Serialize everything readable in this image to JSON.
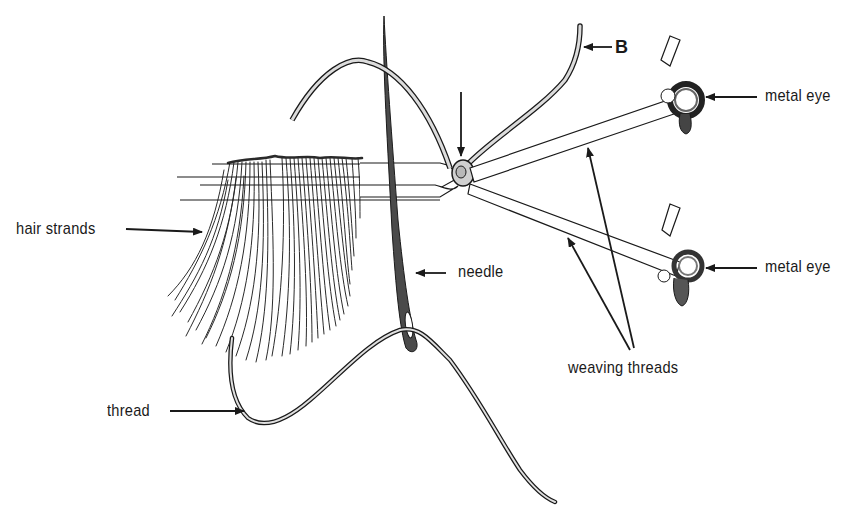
{
  "figure": {
    "type": "labeled line illustration"
  },
  "labels": {
    "b_marker": "B",
    "metal_eye_top": "metal eye",
    "metal_eye_bottom": "metal eye",
    "hair_strands": "hair strands",
    "needle": "needle",
    "weaving_threads": "weaving threads",
    "thread": "thread"
  },
  "colors": {
    "ink": "#1a1a1a",
    "fill_light": "#d6d6d6",
    "fill_dark": "#555555",
    "background": "#ffffff"
  }
}
